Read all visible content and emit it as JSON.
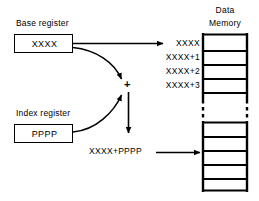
{
  "diagram": {
    "base_register": {
      "caption": "Base register",
      "value": "XXXX"
    },
    "index_register": {
      "caption": "Index register",
      "value": "PPPP"
    },
    "adder": {
      "symbol": "+"
    },
    "sum": {
      "label": "XXXX+PPPP"
    },
    "memory": {
      "title_line1": "Data",
      "title_line2": "Memory",
      "address_labels": [
        "XXXX",
        "XXXX+1",
        "XXXX+2",
        "XXXX+3"
      ],
      "upper_cell_count": 4,
      "lower_cell_count": 5,
      "break_style": "dashed"
    },
    "colors": {
      "ink": "#000000",
      "paper": "#ffffff"
    }
  }
}
